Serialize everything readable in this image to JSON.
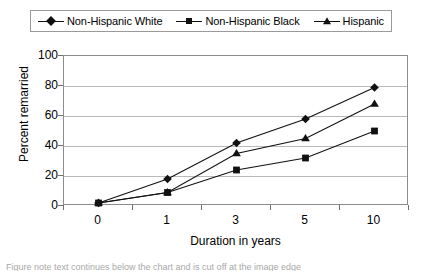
{
  "chart_data": {
    "type": "line",
    "title": "",
    "xlabel": "Duration in years",
    "ylabel": "Percent remarried",
    "categories": [
      "0",
      "1",
      "3",
      "5",
      "10"
    ],
    "x": [
      0,
      1,
      3,
      5,
      10
    ],
    "ylim": [
      0,
      100
    ],
    "yticks": [
      "0",
      "20",
      "40",
      "60",
      "80",
      "100"
    ],
    "ytick_values": [
      0,
      20,
      40,
      60,
      80,
      100
    ],
    "grid": "horizontal",
    "legend_position": "top",
    "series": [
      {
        "name": "Non-Hispanic White",
        "marker": "diamond",
        "values": [
          2,
          18,
          42,
          58,
          79
        ]
      },
      {
        "name": "Non-Hispanic Black",
        "marker": "square",
        "values": [
          2,
          9,
          24,
          32,
          50
        ]
      },
      {
        "name": "Hispanic",
        "marker": "triangle",
        "values": [
          2,
          9,
          35,
          45,
          68
        ]
      }
    ]
  },
  "colors": {
    "series_line": "#111111",
    "marker": "#111111",
    "gridline": "#b9b9b9",
    "frame": "#8c8c8c",
    "legend_border": "#9a9a9a",
    "background": "#ffffff"
  },
  "caption": {
    "text": "Figure note text continues below the chart and is cut off at the image edge"
  }
}
